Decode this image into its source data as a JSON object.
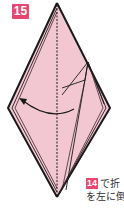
{
  "step": {
    "number": "15",
    "badge_color": "#e8466e"
  },
  "diagram": {
    "paper_color": "#f2c7d2",
    "line_color": "#1a1a1a",
    "shape": "kite",
    "arrow": "curved-arrow-left",
    "center_line": "dashed-valley-fold"
  },
  "caption": {
    "ref_step": "14",
    "line1_text": "で折",
    "line2_text": "を左に倒"
  }
}
